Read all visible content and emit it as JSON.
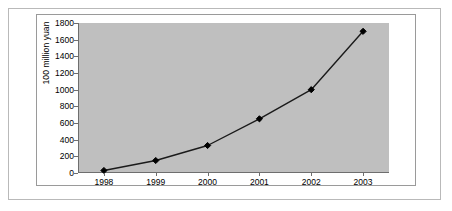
{
  "chart_data": {
    "type": "line",
    "title": "",
    "xlabel": "",
    "ylabel": "100 million yuan",
    "categories": [
      "1998",
      "1999",
      "2000",
      "2001",
      "2002",
      "2003"
    ],
    "series": [
      {
        "name": "",
        "values": [
          30,
          150,
          330,
          650,
          1000,
          1700
        ]
      }
    ],
    "ylim": [
      0,
      1800
    ],
    "yticks": [
      0,
      200,
      400,
      600,
      800,
      1000,
      1200,
      1400,
      1600,
      1800
    ],
    "ytick_labels": [
      "0",
      "200",
      "400",
      "600",
      "800",
      "1000",
      "1200",
      "1400",
      "1600",
      "1800"
    ],
    "grid": false,
    "legend": "none",
    "marker": "diamond",
    "colors": {
      "plot_background": "#bfbfbf",
      "figure_background": "#ffffff",
      "line": "#1a1a1a",
      "marker": "#000000",
      "axis": "#6e6e6e",
      "outer_border": "#b9b9b9",
      "chart_border": "#9a9a9a",
      "text": "#000000"
    }
  }
}
